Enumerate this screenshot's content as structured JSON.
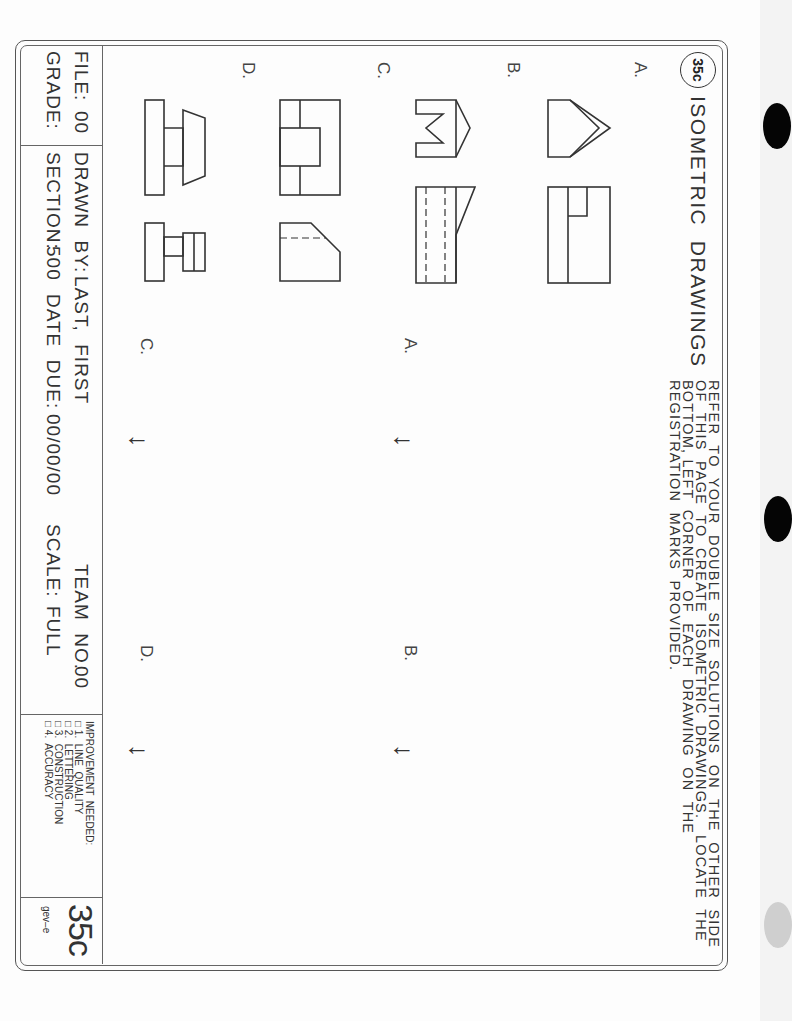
{
  "worksheet": {
    "badge": "35c",
    "title": "ISOMETRIC  DRAWINGS",
    "instructions": [
      "REFER  TO  YOUR  DOUBLE  SIZE  SOLUTIONS  ON  THE  OTHER  SIDE",
      "OF  THIS  PAGE  TO  CREATE  ISOMETRIC  DRAWINGS.   LOCATE  THE",
      "BOTTOM, LEFT  CORNER  OF  EACH  DRAWING  ON  THE",
      "REGISTRATION  MARKS  PROVIDED."
    ],
    "problem_rows": [
      {
        "label": "A."
      },
      {
        "label": "B."
      },
      {
        "label": "C."
      },
      {
        "label": "D."
      }
    ],
    "answer_areas": [
      {
        "label": "A.",
        "mark": "registration-arrow"
      },
      {
        "label": "B.",
        "mark": "registration-arrow"
      },
      {
        "label": "C.",
        "mark": "registration-arrow"
      },
      {
        "label": "D.",
        "mark": "registration-arrow"
      }
    ],
    "registration_glyph": "←"
  },
  "title_block": {
    "file_label": "FILE:",
    "file_value": "00",
    "grade_label": "GRADE:",
    "drawn_by_label": "DRAWN  BY:",
    "drawn_by_value": "LAST,  FIRST",
    "team_label": "TEAM  NO.",
    "team_value": "00",
    "section_label": "SECTION:",
    "section_value": "500",
    "date_due_label": "DATE  DUE:",
    "date_due_value": "00/00/00",
    "scale_label": "SCALE:",
    "scale_value": "FULL",
    "improvement_title": "IMPROVEMENT  NEEDED:",
    "improvement_items": [
      "□ 1.  LINE  QUALITY",
      "□ 2.  LETTERING",
      "□ 3.  CONSTRUCTION",
      "□ 4.  ACCURACY"
    ],
    "sheet_number": "35c",
    "publisher_code": "gev–e"
  },
  "colors": {
    "ink": "#333333",
    "paper": "#fdfdfd",
    "background": "#f3f3f3",
    "binder_hole": "#050505"
  }
}
